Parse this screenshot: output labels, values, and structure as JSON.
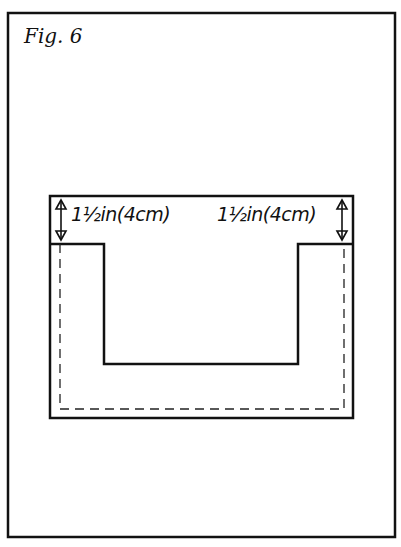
{
  "figure": {
    "title": "Fig. 6",
    "labels": {
      "left_measure": "1½in(4cm)",
      "right_measure": "1½in(4cm)"
    },
    "colors": {
      "ink": "#111111",
      "paper": "#ffffff"
    }
  }
}
